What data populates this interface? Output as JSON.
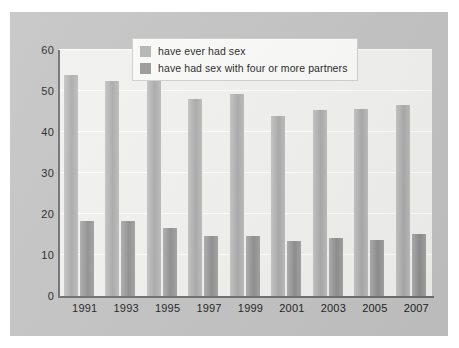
{
  "chart_data": {
    "type": "bar",
    "title": "",
    "subtitle": "",
    "xlabel": "",
    "ylabel": "",
    "categories": [
      "1991",
      "1993",
      "1995",
      "1997",
      "1999",
      "2001",
      "2003",
      "2005",
      "2007"
    ],
    "series": [
      {
        "name": "have ever had sex",
        "color": "#b4b4b4",
        "values": [
          54,
          52.5,
          52.5,
          48,
          49.2,
          44,
          45.4,
          45.6,
          46.7
        ]
      },
      {
        "name": "have had sex with four or more partners",
        "color": "#979797",
        "values": [
          18.2,
          18.2,
          16.5,
          14.6,
          14.7,
          13.5,
          14.1,
          13.7,
          15.2
        ]
      }
    ],
    "ylim": [
      0,
      60
    ],
    "yticks": [
      0,
      10,
      20,
      30,
      40,
      50,
      60
    ],
    "ytick_labels": [
      "0",
      "10",
      "20",
      "30",
      "40",
      "50",
      "60"
    ],
    "grid": true,
    "grid_color": "#ffffff",
    "legend_position": "top-center",
    "plot_background": "#f2f2f0",
    "figure_background": "#c3c3c3",
    "axis_color": "#6e6e6e"
  },
  "legend": {
    "items": [
      {
        "label": "have ever had sex"
      },
      {
        "label": "have had sex with four or more partners"
      }
    ]
  }
}
